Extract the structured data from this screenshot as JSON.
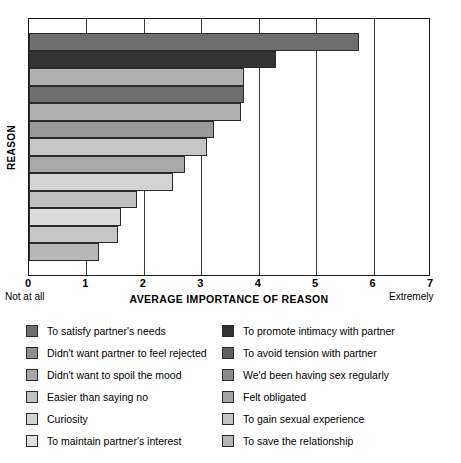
{
  "chart_data": {
    "type": "bar",
    "orientation": "horizontal",
    "title": "",
    "xlabel": "AVERAGE IMPORTANCE OF REASON",
    "ylabel": "REASON",
    "xlim": [
      0,
      7
    ],
    "xticks": [
      0,
      1,
      2,
      3,
      4,
      5,
      6,
      7
    ],
    "xtick_labels": [
      "0",
      "1",
      "2",
      "3",
      "4",
      "5",
      "6",
      "7"
    ],
    "grid": true,
    "grid_axis": "x",
    "scale_anchor_low": "Not at all",
    "scale_anchor_high": "Extremely",
    "legend_position": "below",
    "categories": [
      "To satisfy partner's needs",
      "To promote intimacy with partner",
      "Didn't want partner to feel rejected",
      "To avoid tension with partner",
      "Didn't want to spoil the mood",
      "We'd been having sex regularly",
      "Easier than saying no",
      "Felt obligated",
      "Curiosity",
      "To gain sexual experience",
      "To maintain partner's interest",
      "To save the relationship"
    ],
    "bars": [
      {
        "label": "To satisfy partner's needs",
        "value": 5.75,
        "color": "#6e6e6e"
      },
      {
        "label": "To promote intimacy with partner",
        "value": 4.3,
        "color": "#333333"
      },
      {
        "label": "Didn't want partner to feel rejected",
        "value": 3.75,
        "color": "#b0b0b0"
      },
      {
        "label": "To avoid tension with partner",
        "value": 3.75,
        "color": "#6e6e6e"
      },
      {
        "label": "Didn't want to spoil the mood",
        "value": 3.7,
        "color": "#b0b0b0"
      },
      {
        "label": "We'd been having sex regularly",
        "value": 3.22,
        "color": "#9a9a9a"
      },
      {
        "label": "Easier than saying no",
        "value": 3.1,
        "color": "#c6c6c6"
      },
      {
        "label": "Felt obligated",
        "value": 2.72,
        "color": "#a8a8a8"
      },
      {
        "label": "Curiosity",
        "value": 2.5,
        "color": "#d4d4d4"
      },
      {
        "label": "To gain sexual experience",
        "value": 1.88,
        "color": "#c0c0c0"
      },
      {
        "label": "To maintain partner's interest",
        "value": 1.6,
        "color": "#dcdcdc"
      },
      {
        "label": "To save the relationship",
        "value": 1.55,
        "color": "#c8c8c8"
      },
      {
        "label": "To save the relationship",
        "value": 1.22,
        "color": "#b8b8b8"
      }
    ]
  },
  "legend": {
    "left_column": [
      {
        "label": "To satisfy partner's needs",
        "color": "#6e6e6e"
      },
      {
        "label": "Didn't want partner to feel rejected",
        "color": "#8e8e8e"
      },
      {
        "label": "Didn't want to spoil the mood",
        "color": "#a8a8a8"
      },
      {
        "label": "Easier than saying no",
        "color": "#c0c0c0"
      },
      {
        "label": "Curiosity",
        "color": "#d2d2d2"
      },
      {
        "label": "To maintain partner's interest",
        "color": "#e0e0e0"
      }
    ],
    "right_column": [
      {
        "label": "To promote intimacy with partner",
        "color": "#333333"
      },
      {
        "label": "To avoid tension with partner",
        "color": "#5e5e5e"
      },
      {
        "label": "We'd been having sex regularly",
        "color": "#8a8a8a"
      },
      {
        "label": "Felt obligated",
        "color": "#a4a4a4"
      },
      {
        "label": "To gain sexual experience",
        "color": "#c4c4c4"
      },
      {
        "label": "To save the relationship",
        "color": "#b6b6b6"
      }
    ]
  }
}
